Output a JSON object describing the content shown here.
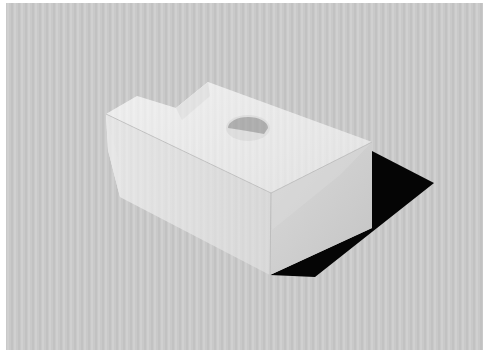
{
  "canvas": {
    "width": 490,
    "height": 362,
    "border_color": "#ffffff"
  },
  "backdrop": {
    "x": 6,
    "y": 3,
    "width": 477,
    "height": 347,
    "base_color": "#c9c9c9",
    "stripe_light": "#d6d6d6",
    "stripe_dark": "#bdbdbd",
    "stripe_period": 7
  },
  "object": {
    "name": "white block with stepped top and semicircular notch",
    "faces": {
      "top": {
        "points": "106,114 137,96 176,108 208,82 372,142 271,193",
        "color": "#f1f1f1"
      },
      "top_step_ledge": {
        "points": "176,108 208,82 210,96 182,120",
        "color": "#e8e8e8"
      },
      "front": {
        "points": "106,114 271,193 270,275 120,197 108,150",
        "color": "#e4e4e4"
      },
      "front_bevel": {
        "points": "106,114 108,150 120,197 118,158",
        "color": "#ededed"
      },
      "end": {
        "points": "271,193 372,142 372,228 270,275",
        "color": "#cfcfcf"
      },
      "end_highlight": {
        "points": "271,193 372,142 340,175 272,230",
        "color": "#dadada"
      }
    },
    "notch": {
      "cx": 248,
      "cy": 128,
      "rx": 20,
      "ry": 11,
      "color": "#a9a9a9",
      "rim_color": "#e2e2e2"
    },
    "edge_color": "#b8b8b8",
    "shadow": {
      "points": "270,275 372,228 372,151 434,183 315,277",
      "color": "#050505"
    }
  }
}
